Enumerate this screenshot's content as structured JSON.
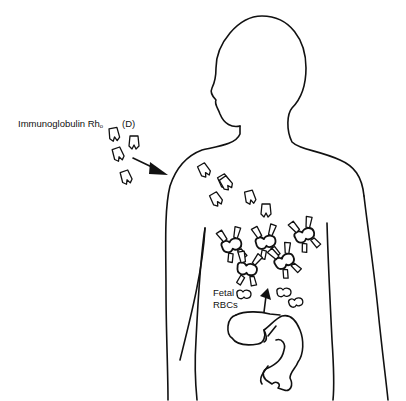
{
  "diagram": {
    "labels": {
      "immunoglobulin": "Immunoglobulin Rh",
      "immunoglobulin_sub": "o",
      "immunoglobulin_d": "(D)",
      "fetal_line1": "Fetal",
      "fetal_line2": "RBCs"
    },
    "elements": {
      "body": "adult-body-silhouette",
      "fetus": "fetus-in-utero",
      "free_antibodies": 11,
      "antibody_coated_rbcs": 6,
      "free_fetal_rbcs": 3,
      "arrows": [
        "injection-arrow",
        "fetal-rbc-arrow"
      ]
    },
    "colors": {
      "line": "#111111",
      "background": "#ffffff"
    }
  }
}
